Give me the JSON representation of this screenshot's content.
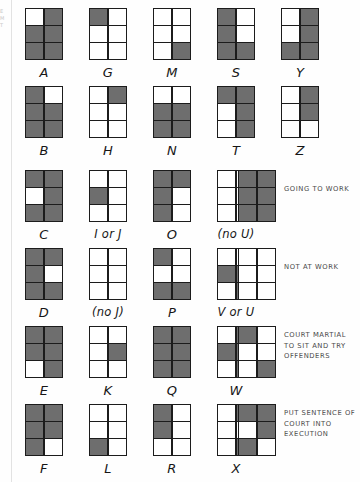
{
  "page": {
    "colors": {
      "filled": "#6e6e6e",
      "empty": "#ffffff",
      "outline": "#1c1c1c",
      "legend_text": "#4a4a4a"
    },
    "edge_marks": [
      "E",
      "M",
      "",
      "",
      "T"
    ]
  },
  "grid_spec": {
    "columns": 2,
    "rows": 3,
    "cell_count": 6,
    "order": "row-major: [r1c1, r1c2, r2c1, r2c2, r3c1, r3c2]",
    "state_legend": {
      "1": "filled",
      "0": "empty"
    }
  },
  "rows": [
    {
      "index": 0,
      "items": [
        {
          "label": "A",
          "cells": [
            0,
            1,
            1,
            1,
            1,
            1
          ]
        },
        {
          "label": "G",
          "cells": [
            1,
            0,
            0,
            0,
            0,
            0
          ]
        },
        {
          "label": "M",
          "cells": [
            0,
            0,
            0,
            0,
            0,
            1
          ]
        },
        {
          "label": "S",
          "cells": [
            1,
            0,
            1,
            0,
            1,
            1
          ]
        },
        {
          "label": "Y",
          "cells": [
            0,
            1,
            0,
            1,
            1,
            1
          ]
        }
      ],
      "legend": null
    },
    {
      "index": 1,
      "items": [
        {
          "label": "B",
          "cells": [
            1,
            0,
            1,
            1,
            1,
            1
          ]
        },
        {
          "label": "H",
          "cells": [
            0,
            1,
            0,
            0,
            0,
            0
          ]
        },
        {
          "label": "N",
          "cells": [
            0,
            0,
            1,
            1,
            1,
            1
          ]
        },
        {
          "label": "T",
          "cells": [
            1,
            1,
            0,
            1,
            0,
            1
          ]
        },
        {
          "label": "Z",
          "cells": [
            0,
            1,
            0,
            1,
            0,
            0
          ]
        }
      ],
      "legend": null
    },
    {
      "index": 2,
      "items": [
        {
          "label": "C",
          "cells": [
            1,
            1,
            0,
            1,
            1,
            1
          ]
        },
        {
          "label": "I or J",
          "cells": [
            0,
            0,
            1,
            0,
            0,
            0
          ]
        },
        {
          "label": "O",
          "cells": [
            1,
            1,
            1,
            0,
            1,
            0
          ]
        },
        {
          "label": "(no U)",
          "cells": [
            0,
            0,
            0,
            0,
            0,
            0
          ]
        }
      ],
      "legend": {
        "cells": [
          1,
          1,
          1,
          1,
          1,
          1
        ],
        "text": "GOING TO WORK"
      }
    },
    {
      "index": 3,
      "items": [
        {
          "label": "D",
          "cells": [
            1,
            1,
            1,
            0,
            1,
            1
          ]
        },
        {
          "label": "(no J)",
          "cells": [
            0,
            0,
            0,
            0,
            0,
            0
          ]
        },
        {
          "label": "P",
          "cells": [
            1,
            0,
            0,
            0,
            1,
            1
          ]
        },
        {
          "label": "V or U",
          "cells": [
            0,
            0,
            1,
            1,
            0,
            1
          ]
        }
      ],
      "legend": {
        "cells": [
          0,
          0,
          0,
          0,
          0,
          0
        ],
        "text": "NOT AT WORK"
      }
    },
    {
      "index": 4,
      "items": [
        {
          "label": "E",
          "cells": [
            1,
            1,
            1,
            1,
            0,
            1
          ]
        },
        {
          "label": "K",
          "cells": [
            0,
            0,
            0,
            1,
            0,
            0
          ]
        },
        {
          "label": "Q",
          "cells": [
            1,
            1,
            1,
            1,
            1,
            1
          ]
        },
        {
          "label": "W",
          "cells": [
            0,
            1,
            1,
            1,
            0,
            1
          ]
        }
      ],
      "legend": {
        "cells": [
          1,
          0,
          0,
          0,
          0,
          1
        ],
        "text": "COURT MARTIAL\nTO SIT AND TRY\nOFFENDERS"
      }
    },
    {
      "index": 5,
      "items": [
        {
          "label": "F",
          "cells": [
            1,
            1,
            1,
            1,
            1,
            0
          ]
        },
        {
          "label": "L",
          "cells": [
            0,
            0,
            0,
            0,
            1,
            0
          ]
        },
        {
          "label": "R",
          "cells": [
            1,
            0,
            1,
            0,
            0,
            0
          ]
        },
        {
          "label": "X",
          "cells": [
            0,
            1,
            0,
            0,
            0,
            1
          ]
        }
      ],
      "legend": {
        "cells": [
          1,
          1,
          0,
          1,
          1,
          0
        ],
        "text": "PUT SENTENCE OF\nCOURT INTO\nEXECUTION"
      }
    }
  ]
}
